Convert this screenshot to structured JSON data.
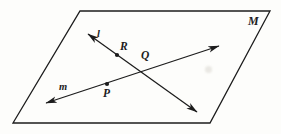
{
  "figure": {
    "kind": "geometry-diagram",
    "background_color": "#fdfdfb",
    "ink_color": "#1c1c1c",
    "plane": {
      "name_label": "M",
      "label_position": {
        "x": 248,
        "y": 15
      },
      "outline_points": "80,11 270,11 210,123 13,123",
      "stroke_width": 1.3
    },
    "lines": [
      {
        "id": "line-l",
        "label": "l",
        "label_position": {
          "x": 97,
          "y": 29
        },
        "from": {
          "x": 88,
          "y": 34
        },
        "to": {
          "x": 197,
          "y": 112
        },
        "arrow_start": true,
        "arrow_end": true,
        "stroke_width": 1.25
      },
      {
        "id": "line-m",
        "label": "m",
        "label_position": {
          "x": 59,
          "y": 82
        },
        "from": {
          "x": 46,
          "y": 103
        },
        "to": {
          "x": 219,
          "y": 46
        },
        "arrow_start": true,
        "arrow_end": true,
        "stroke_width": 1.25
      }
    ],
    "points": [
      {
        "id": "point-R",
        "label": "R",
        "dot": {
          "x": 117,
          "y": 55
        },
        "label_position": {
          "x": 120,
          "y": 41
        }
      },
      {
        "id": "point-Q",
        "label": "Q",
        "dot": {
          "x": 147,
          "y": 68
        },
        "label_position": {
          "x": 141,
          "y": 50
        },
        "dot_visible": false
      },
      {
        "id": "point-P",
        "label": "P",
        "dot": {
          "x": 107,
          "y": 84
        },
        "label_position": {
          "x": 103,
          "y": 88
        }
      }
    ],
    "dot_radius": 2.1,
    "smudges": [
      {
        "x": 205,
        "y": 66,
        "w": 7,
        "h": 7
      }
    ]
  }
}
